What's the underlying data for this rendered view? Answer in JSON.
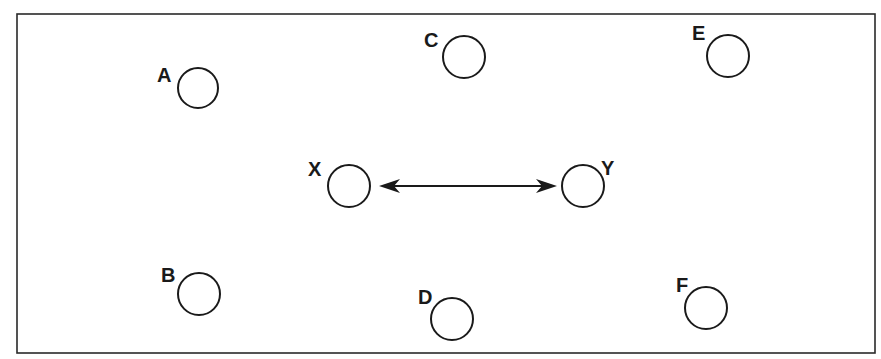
{
  "diagram": {
    "frame": {
      "x": 17,
      "y": 14,
      "width": 858,
      "height": 339
    },
    "nodes": [
      {
        "id": "A",
        "label": "A",
        "cx": 198,
        "cy": 88,
        "r": 20,
        "lx": 157,
        "ly": 82
      },
      {
        "id": "B",
        "label": "B",
        "cx": 199,
        "cy": 294,
        "r": 21,
        "lx": 161,
        "ly": 282
      },
      {
        "id": "C",
        "label": "C",
        "cx": 464,
        "cy": 57,
        "r": 21,
        "lx": 424,
        "ly": 47
      },
      {
        "id": "D",
        "label": "D",
        "cx": 452,
        "cy": 319,
        "r": 21,
        "lx": 418,
        "ly": 304
      },
      {
        "id": "E",
        "label": "E",
        "cx": 728,
        "cy": 56,
        "r": 21,
        "lx": 692,
        "ly": 40
      },
      {
        "id": "F",
        "label": "F",
        "cx": 706,
        "cy": 308,
        "r": 21,
        "lx": 676,
        "ly": 292
      },
      {
        "id": "X",
        "label": "X",
        "cx": 349,
        "cy": 186,
        "r": 21,
        "lx": 308,
        "ly": 176
      },
      {
        "id": "Y",
        "label": "Y",
        "cx": 583,
        "cy": 186,
        "r": 21,
        "lx": 601,
        "ly": 175
      }
    ],
    "arrow": {
      "from": "X",
      "to": "Y",
      "x1": 380,
      "x2": 556,
      "y": 186,
      "type": "double-headed"
    },
    "colors": {
      "stroke": "#1a1a1a",
      "background": "#ffffff"
    }
  }
}
